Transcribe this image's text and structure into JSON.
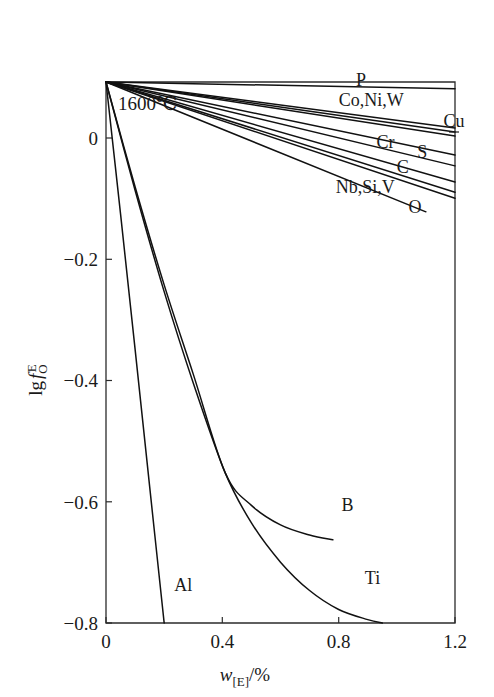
{
  "chart_data": {
    "type": "line",
    "title": "",
    "annotation": "1600℃",
    "xlabel_parts": {
      "symbol": "w",
      "subscript": "[E]",
      "unit": "/%"
    },
    "xlabel": "w[E]/%",
    "ylabel_parts": {
      "prefix": "lg",
      "symbol": "f",
      "subscript": "O",
      "superscript": "E"
    },
    "ylabel": "lg fOE",
    "xlim": [
      0,
      1.2
    ],
    "ylim": [
      -0.8,
      0
    ],
    "xticks": [
      0,
      0.4,
      0.8,
      1.2
    ],
    "xticklabels": [
      "0",
      "0.4",
      "0.8",
      "1.2"
    ],
    "yticks": [
      0,
      -0.2,
      -0.4,
      -0.6,
      -0.8
    ],
    "yticklabels": [
      "0",
      "−0.2",
      "−0.4",
      "−0.6",
      "−0.8"
    ],
    "grid": false,
    "legend_position": "inline-end-labels",
    "series": [
      {
        "name": "P",
        "label": "P",
        "label_x": 0.86,
        "label_y": -0.012,
        "points": [
          [
            0,
            0
          ],
          [
            1.2,
            -0.01
          ]
        ]
      },
      {
        "name": "Co,Ni,W",
        "label": "Co,Ni,W",
        "label_x": 0.8,
        "label_y": -0.042,
        "points": [
          [
            0,
            0
          ],
          [
            1.2,
            -0.068
          ]
        ]
      },
      {
        "name": "Co,Ni,W-b",
        "label": "",
        "label_x": null,
        "label_y": null,
        "points": [
          [
            0,
            0
          ],
          [
            1.2,
            -0.074
          ]
        ]
      },
      {
        "name": "Cu",
        "label": "Cu",
        "label_x": 1.16,
        "label_y": -0.073,
        "points": [
          [
            0,
            0
          ],
          [
            1.2,
            -0.08
          ]
        ]
      },
      {
        "name": "Cr",
        "label": "Cr",
        "label_x": 0.93,
        "label_y": -0.103,
        "points": [
          [
            0,
            0
          ],
          [
            1.2,
            -0.108
          ]
        ]
      },
      {
        "name": "S",
        "label": "S",
        "label_x": 1.07,
        "label_y": -0.118,
        "points": [
          [
            0,
            0
          ],
          [
            1.2,
            -0.124
          ]
        ]
      },
      {
        "name": "C",
        "label": "C",
        "label_x": 1.0,
        "label_y": -0.14,
        "points": [
          [
            0,
            0
          ],
          [
            1.2,
            -0.148
          ]
        ]
      },
      {
        "name": "Nb,Si,V",
        "label": "Nb,Si,V",
        "label_x": 0.79,
        "label_y": -0.17,
        "points": [
          [
            0,
            0
          ],
          [
            1.2,
            -0.163
          ]
        ]
      },
      {
        "name": "Nb,Si,V-b",
        "label": "",
        "label_x": null,
        "label_y": null,
        "points": [
          [
            0,
            0
          ],
          [
            1.2,
            -0.172
          ]
        ]
      },
      {
        "name": "O",
        "label": "O",
        "label_x": 1.04,
        "label_y": -0.2,
        "points": [
          [
            0,
            0
          ],
          [
            1.1,
            -0.192
          ]
        ]
      },
      {
        "name": "B",
        "label": "B",
        "label_x": 0.81,
        "label_y": -0.64,
        "points": [
          [
            0,
            0
          ],
          [
            0.1,
            -0.155
          ],
          [
            0.2,
            -0.3
          ],
          [
            0.3,
            -0.432
          ],
          [
            0.41,
            -0.578
          ],
          [
            0.5,
            -0.626
          ],
          [
            0.6,
            -0.655
          ],
          [
            0.7,
            -0.67
          ],
          [
            0.78,
            -0.677
          ]
        ]
      },
      {
        "name": "Ti",
        "label": "Ti",
        "label_x": 0.89,
        "label_y": -0.748,
        "points": [
          [
            0,
            0
          ],
          [
            0.1,
            -0.16
          ],
          [
            0.2,
            -0.31
          ],
          [
            0.3,
            -0.445
          ],
          [
            0.41,
            -0.578
          ],
          [
            0.5,
            -0.652
          ],
          [
            0.6,
            -0.71
          ],
          [
            0.7,
            -0.752
          ],
          [
            0.8,
            -0.78
          ],
          [
            0.9,
            -0.795
          ],
          [
            0.95,
            -0.8
          ]
        ]
      },
      {
        "name": "Al",
        "label": "Al",
        "label_x": 0.235,
        "label_y": -0.758,
        "points": [
          [
            0,
            0
          ],
          [
            0.05,
            -0.195
          ],
          [
            0.1,
            -0.395
          ],
          [
            0.15,
            -0.598
          ],
          [
            0.2,
            -0.8
          ]
        ]
      }
    ]
  }
}
